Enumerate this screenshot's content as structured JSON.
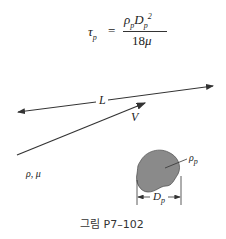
{
  "equation": {
    "lhs": "τ",
    "lhs_sub": "p",
    "equals": "=",
    "numerator_rho": "ρ",
    "numerator_rho_sub": "p",
    "numerator_D": "D",
    "numerator_D_sub": "p",
    "numerator_D_sup": "2",
    "denominator_num": "18",
    "denominator_mu": "μ"
  },
  "labels": {
    "length": "L",
    "velocity": "V",
    "fluid_props": "ρ, μ",
    "particle_density": "ρ",
    "particle_density_sub": "p",
    "particle_diameter": "D",
    "particle_diameter_sub": "p"
  },
  "caption": "그림 P7–102",
  "colors": {
    "particle_fill": "#8a8a8a",
    "line": "#333333"
  }
}
